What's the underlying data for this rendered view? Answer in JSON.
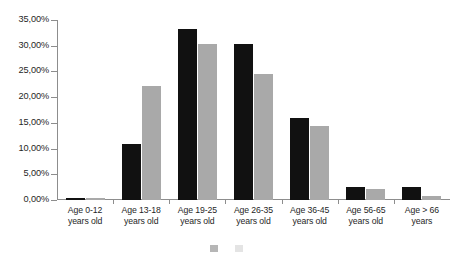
{
  "chart_data": {
    "type": "bar",
    "title": "",
    "xlabel": "",
    "ylabel": "",
    "ylim": [
      0,
      35
    ],
    "grid": false,
    "legend_position": "bottom",
    "categories": [
      "Age 0-12 years old",
      "Age 13-18 years old",
      "Age 19-25 years old",
      "Age 26-35 years old",
      "Age 36-45 years old",
      "Age 56-65 years old",
      "Age > 66 years"
    ],
    "category_lines": [
      [
        "Age 0-12",
        "years old"
      ],
      [
        "Age 13-18",
        "years old"
      ],
      [
        "Age 19-25",
        "years old"
      ],
      [
        "Age 26-35",
        "years old"
      ],
      [
        "Age 36-45",
        "years old"
      ],
      [
        "Age 56-65",
        "years old"
      ],
      [
        "Age > 66 years",
        ""
      ]
    ],
    "ytick_labels": [
      "0,00%",
      "5,00%",
      "10,00%",
      "15,00%",
      "20,00%",
      "25,00%",
      "30,00%",
      "35,00%"
    ],
    "ytick_values": [
      0,
      5,
      10,
      15,
      20,
      25,
      30,
      35
    ],
    "series": [
      {
        "name": "",
        "color": "#111111",
        "values": [
          0.4,
          10.9,
          33.2,
          30.3,
          15.9,
          2.5,
          2.6
        ]
      },
      {
        "name": "",
        "color": "#a9a9a9",
        "values": [
          0.4,
          22.2,
          30.4,
          24.6,
          14.4,
          2.2,
          0.7
        ]
      }
    ]
  },
  "axis": {
    "line_color": "#8d8d8d"
  }
}
